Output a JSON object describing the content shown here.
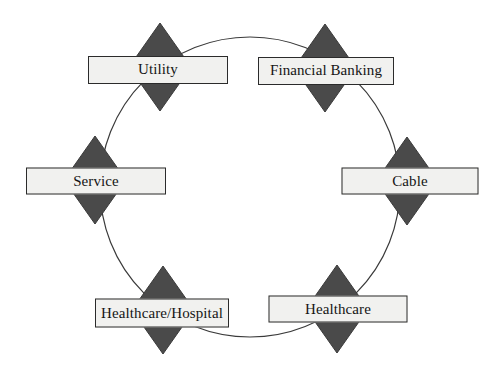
{
  "diagram": {
    "type": "cycle-diagram",
    "title": "",
    "background_color": "#ffffff",
    "ring": {
      "shape": "circle",
      "center_x": 250,
      "center_y": 187,
      "radius": 150,
      "stroke_color": "#3a3a3a",
      "stroke_width": 1.2,
      "fill": "none"
    },
    "style": {
      "diamond_fill": "#4a4a4a",
      "diamond_stroke": "#3a3a3a",
      "label_fill": "#f1f1ef",
      "label_stroke": "#2b2b2b",
      "label_text_color": "#151515"
    },
    "nodes": [
      {
        "id": "utility",
        "label": "Utility",
        "icon": "diamond-shape",
        "center_x": 160,
        "center_y": 67,
        "diamond_width": 62,
        "diamond_height": 88,
        "box_width": 140,
        "box_height": 28,
        "box_center_x": 158,
        "box_center_y": 70,
        "font_size": 15
      },
      {
        "id": "financial-banking",
        "label": "Financial Banking",
        "icon": "diamond-shape",
        "center_x": 325,
        "center_y": 68,
        "diamond_width": 62,
        "diamond_height": 88,
        "box_width": 136,
        "box_height": 28,
        "box_center_x": 326,
        "box_center_y": 71,
        "font_size": 15
      },
      {
        "id": "cable",
        "label": "Cable",
        "icon": "diamond-shape",
        "center_x": 407,
        "center_y": 181,
        "diamond_width": 62,
        "diamond_height": 88,
        "box_width": 137,
        "box_height": 27,
        "box_center_x": 410,
        "box_center_y": 181,
        "font_size": 15
      },
      {
        "id": "healthcare",
        "label": "Healthcare",
        "icon": "diamond-shape",
        "center_x": 337,
        "center_y": 309,
        "diamond_width": 62,
        "diamond_height": 88,
        "box_width": 139,
        "box_height": 27,
        "box_center_x": 338,
        "box_center_y": 309,
        "font_size": 15
      },
      {
        "id": "healthcare-hospital",
        "label": "Healthcare/Hospital",
        "icon": "diamond-shape",
        "center_x": 163,
        "center_y": 310,
        "diamond_width": 62,
        "diamond_height": 88,
        "box_width": 134,
        "box_height": 29,
        "box_center_x": 162,
        "box_center_y": 313,
        "font_size": 15
      },
      {
        "id": "service",
        "label": "Service",
        "icon": "diamond-shape",
        "center_x": 95,
        "center_y": 180,
        "diamond_width": 62,
        "diamond_height": 88,
        "box_width": 140,
        "box_height": 27,
        "box_center_x": 96,
        "box_center_y": 181,
        "font_size": 15
      }
    ]
  }
}
